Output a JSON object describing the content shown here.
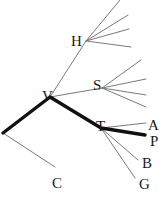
{
  "diagram": {
    "type": "tree",
    "nodes": [
      {
        "id": "V",
        "label": "V",
        "x": 50,
        "y": 97
      },
      {
        "id": "H",
        "label": "H",
        "x": 86,
        "y": 41
      },
      {
        "id": "S",
        "label": "S",
        "x": 102,
        "y": 88
      },
      {
        "id": "T",
        "label": "T",
        "x": 101,
        "y": 128
      },
      {
        "id": "R",
        "label": "",
        "x": 3,
        "y": 133
      },
      {
        "id": "C",
        "label": "C",
        "x": 55,
        "y": 167
      },
      {
        "id": "A",
        "label": "A",
        "x": 146,
        "y": 123
      },
      {
        "id": "P",
        "label": "P",
        "x": 145,
        "y": 135
      },
      {
        "id": "B",
        "label": "B",
        "x": 138,
        "y": 160
      },
      {
        "id": "G",
        "label": "G",
        "x": 135,
        "y": 178
      }
    ],
    "labels": {
      "V": "V",
      "H": "H",
      "S": "S",
      "T": "T",
      "A": "A",
      "P": "P",
      "B": "B",
      "G": "G",
      "C": "C"
    },
    "edges": [
      {
        "from": "R",
        "to": "V",
        "weight": "thick"
      },
      {
        "from": "V",
        "to": "T",
        "weight": "thick"
      },
      {
        "from": "T",
        "to": "P",
        "weight": "thick"
      },
      {
        "from": "R",
        "to": "C",
        "weight": "thin"
      },
      {
        "from": "V",
        "to": "H",
        "weight": "thin"
      },
      {
        "from": "V",
        "to": "S",
        "weight": "thin"
      },
      {
        "from": "T",
        "to": "A",
        "weight": "thin"
      },
      {
        "from": "T",
        "to": "B",
        "weight": "thin"
      },
      {
        "from": "T",
        "to": "G",
        "weight": "thin"
      },
      {
        "from": "H",
        "to": "leaf",
        "weight": "thin",
        "count": 4
      },
      {
        "from": "S",
        "to": "leaf",
        "weight": "thin",
        "count": 4
      }
    ],
    "highlighted_path": [
      "R",
      "V",
      "T",
      "P"
    ]
  }
}
